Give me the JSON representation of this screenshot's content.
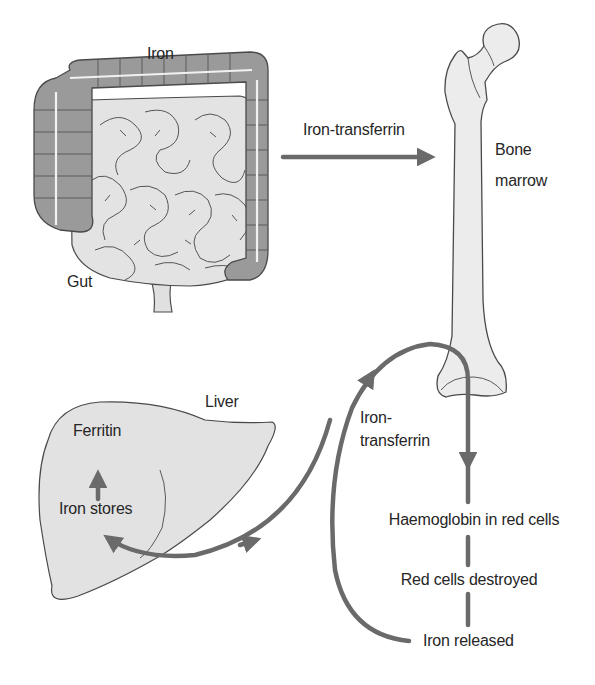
{
  "diagram": {
    "colors": {
      "background": "#ffffff",
      "arrow": "#6a6a6a",
      "colon_fill": "#999999",
      "organ_fill": "#e2e2e2",
      "bone_fill": "#ececec",
      "outline": "#4a4a4a",
      "text": "#262626"
    },
    "nodes": {
      "iron": "Iron",
      "gut": "Gut",
      "iron_transferrin_top": "Iron-transferrin",
      "bone_marrow_line1": "Bone",
      "bone_marrow_line2": "marrow",
      "liver": "Liver",
      "ferritin": "Ferritin",
      "iron_stores": "Iron stores",
      "iron_transferrin_loop_line1": "Iron-",
      "iron_transferrin_loop_line2": "transferrin",
      "haemoglobin": "Haemoglobin in red cells",
      "red_cells_destroyed": "Red cells destroyed",
      "iron_released": "Iron released"
    },
    "edges": [
      {
        "from": "Gut",
        "to": "Bone marrow",
        "label": "Iron-transferrin"
      },
      {
        "from": "Iron stores",
        "to": "Ferritin",
        "label": ""
      },
      {
        "from": "Iron stores",
        "to": "Bone marrow",
        "label": "Iron-transferrin",
        "bidirectional_with": "Liver"
      },
      {
        "from": "Bone marrow",
        "to": "Haemoglobin in red cells",
        "label": ""
      },
      {
        "from": "Haemoglobin in red cells",
        "to": "Red cells destroyed",
        "label": ""
      },
      {
        "from": "Red cells destroyed",
        "to": "Iron released",
        "label": ""
      },
      {
        "from": "Iron released",
        "to": "Iron-transferrin",
        "label": ""
      }
    ],
    "icons": [
      "intestine-icon",
      "femur-bone-icon",
      "liver-icon"
    ]
  }
}
